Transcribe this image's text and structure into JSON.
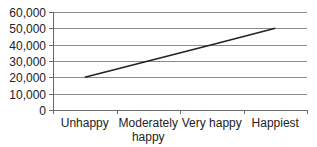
{
  "chart_data": {
    "type": "line",
    "title": "",
    "xlabel": "",
    "ylabel": "",
    "categories": [
      "Unhappy",
      "Moderately happy",
      "Very happy",
      "Happiest"
    ],
    "category_lines": [
      [
        "Unhappy"
      ],
      [
        "Moderately",
        "happy"
      ],
      [
        "Very happy"
      ],
      [
        "Happiest"
      ]
    ],
    "series": [
      {
        "name": "Series 1",
        "values": [
          20000,
          30000,
          40000,
          50000
        ],
        "color": "#222222"
      }
    ],
    "ylim": [
      0,
      60000
    ],
    "yticks": [
      0,
      10000,
      20000,
      30000,
      40000,
      50000,
      60000
    ],
    "ytick_labels": [
      "0",
      "10,000",
      "20,000",
      "30,000",
      "40,000",
      "50,000",
      "60,000"
    ],
    "grid": true,
    "legend": "none"
  },
  "colors": {
    "gridline": "#8a8a8a",
    "axis": "#6a6a6a",
    "line": "#222222",
    "text": "#222222"
  }
}
